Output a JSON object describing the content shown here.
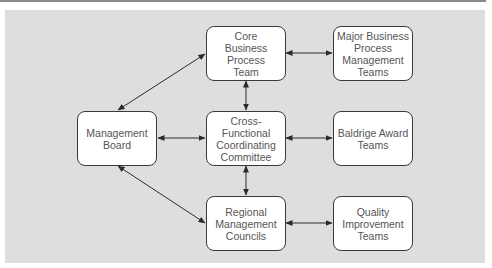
{
  "diagram": {
    "nodes": [
      {
        "id": "core",
        "label": "Core\nBusiness\nProcess\nTeam",
        "x": 206,
        "y": 26
      },
      {
        "id": "major",
        "label": "Major Business\nProcess\nManagement\nTeams",
        "x": 333,
        "y": 26
      },
      {
        "id": "board",
        "label": "Management\nBoard",
        "x": 77,
        "y": 111
      },
      {
        "id": "cross",
        "label": "Cross-\nFunctional\nCoordinating\nCommittee",
        "x": 206,
        "y": 111
      },
      {
        "id": "baldrige",
        "label": "Baldrige Award\nTeams",
        "x": 333,
        "y": 111
      },
      {
        "id": "regional",
        "label": "Regional\nManagement\nCouncils",
        "x": 206,
        "y": 196
      },
      {
        "id": "quality",
        "label": "Quality\nImprovement\nTeams",
        "x": 333,
        "y": 196
      }
    ],
    "edges": [
      {
        "from": "board",
        "to": "core",
        "type": "bidirectional"
      },
      {
        "from": "board",
        "to": "cross",
        "type": "bidirectional"
      },
      {
        "from": "board",
        "to": "regional",
        "type": "bidirectional"
      },
      {
        "from": "core",
        "to": "major",
        "type": "bidirectional"
      },
      {
        "from": "core",
        "to": "cross",
        "type": "bidirectional"
      },
      {
        "from": "cross",
        "to": "baldrige",
        "type": "bidirectional"
      },
      {
        "from": "cross",
        "to": "regional",
        "type": "bidirectional"
      },
      {
        "from": "regional",
        "to": "quality",
        "type": "bidirectional"
      }
    ],
    "colors": {
      "panel": "#dedede",
      "node_fill": "#ffffff",
      "stroke": "#2a2a2a",
      "text": "#555555"
    }
  }
}
